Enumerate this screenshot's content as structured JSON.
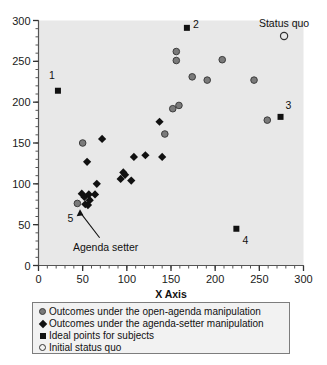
{
  "chart_data": {
    "type": "scatter",
    "title": "",
    "xlabel": "X Axis",
    "ylabel": "",
    "xlim": [
      0,
      300
    ],
    "ylim": [
      0,
      300
    ],
    "xticks": [
      0,
      50,
      100,
      150,
      200,
      250,
      300
    ],
    "yticks": [
      0,
      50,
      100,
      150,
      200,
      250,
      300
    ],
    "xtick_labels": [
      "0",
      "50",
      "100",
      "150",
      "200",
      "250",
      "300"
    ],
    "ytick_labels": [
      "0",
      "50",
      "100",
      "150",
      "200",
      "250",
      "300"
    ],
    "minor_tick_step": 10,
    "grid": false,
    "legend_position": "below-axes",
    "plot_bg_color": "#e8e8e8",
    "series": [
      {
        "name": "Outcomes under the open-agenda manipulation",
        "marker": "circle",
        "color": "#7a7a7a",
        "edge_color": "#3c3c3c",
        "points": [
          [
            44,
            76
          ],
          [
            50,
            150
          ],
          [
            143,
            161
          ],
          [
            152,
            192
          ],
          [
            159,
            196
          ],
          [
            156,
            251
          ],
          [
            156,
            262
          ],
          [
            174,
            231
          ],
          [
            191,
            227
          ],
          [
            208,
            252
          ],
          [
            244,
            227
          ],
          [
            259,
            178
          ]
        ]
      },
      {
        "name": "Outcomes under the agenda-setter manipulation",
        "marker": "diamond",
        "color": "#111111",
        "points": [
          [
            49,
            88
          ],
          [
            52,
            84
          ],
          [
            53,
            75
          ],
          [
            56,
            74
          ],
          [
            57,
            87
          ],
          [
            58,
            80
          ],
          [
            64,
            87
          ],
          [
            66,
            100
          ],
          [
            55,
            127
          ],
          [
            72,
            155
          ],
          [
            93,
            106
          ],
          [
            96,
            114
          ],
          [
            98,
            111
          ],
          [
            105,
            104
          ],
          [
            108,
            133
          ],
          [
            121,
            135
          ],
          [
            140,
            133
          ],
          [
            137,
            176
          ]
        ]
      },
      {
        "name": "Ideal points for subjects",
        "marker": "square",
        "color": "#111111",
        "points": [
          [
            22,
            214
          ],
          [
            168,
            291
          ],
          [
            274,
            182
          ],
          [
            224,
            45
          ]
        ]
      },
      {
        "name": "Initial status quo",
        "marker": "open-circle",
        "color": "#ffffff",
        "edge_color": "#333333",
        "points": [
          [
            278,
            281
          ]
        ]
      }
    ],
    "point_labels": [
      {
        "text": "1",
        "x": 22,
        "y": 214,
        "dx": -6,
        "dy": 16
      },
      {
        "text": "2",
        "x": 168,
        "y": 291,
        "dx": 9,
        "dy": 4
      },
      {
        "text": "3",
        "x": 274,
        "y": 182,
        "dx": 8,
        "dy": 12
      },
      {
        "text": "4",
        "x": 224,
        "y": 45,
        "dx": 9,
        "dy": -11
      },
      {
        "text": "5",
        "x": 44,
        "y": 76,
        "dx": -7,
        "dy": -15
      }
    ],
    "annotations": [
      {
        "text": "Status quo",
        "x": 278,
        "y": 297
      },
      {
        "text": "Agenda setter",
        "x": 76,
        "y": 23
      }
    ]
  },
  "axes": {
    "x_title": "X Axis"
  },
  "legend": {
    "items": [
      {
        "marker": "gray-filled-circle-marker",
        "label": "Outcomes under the open-agenda manipulation"
      },
      {
        "marker": "black-filled-diamond-marker",
        "label": "Outcomes under the agenda-setter manipulation"
      },
      {
        "marker": "black-filled-square-marker",
        "label": "Ideal points for subjects"
      },
      {
        "marker": "open-circle-marker",
        "label": "Initial status quo"
      }
    ]
  }
}
